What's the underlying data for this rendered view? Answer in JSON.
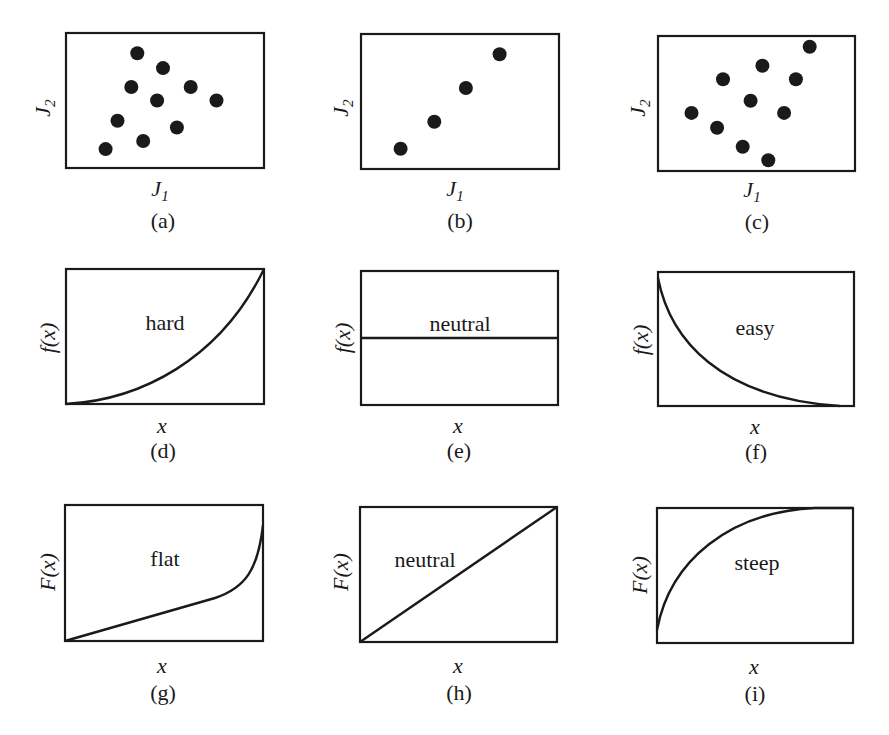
{
  "chart_data": [
    {
      "id": "a",
      "type": "scatter",
      "caption": "(a)",
      "xlabel": "J1",
      "ylabel": "J2",
      "points": [
        [
          0.36,
          0.15
        ],
        [
          0.49,
          0.26
        ],
        [
          0.33,
          0.4
        ],
        [
          0.63,
          0.4
        ],
        [
          0.46,
          0.5
        ],
        [
          0.76,
          0.5
        ],
        [
          0.26,
          0.65
        ],
        [
          0.56,
          0.7
        ],
        [
          0.39,
          0.8
        ],
        [
          0.2,
          0.86
        ]
      ]
    },
    {
      "id": "b",
      "type": "scatter",
      "caption": "(b)",
      "xlabel": "J1",
      "ylabel": "J2",
      "points": [
        [
          0.2,
          0.85
        ],
        [
          0.37,
          0.65
        ],
        [
          0.53,
          0.4
        ],
        [
          0.7,
          0.15
        ]
      ]
    },
    {
      "id": "c",
      "type": "scatter",
      "caption": "(c)",
      "xlabel": "J1",
      "ylabel": "J2",
      "points": [
        [
          0.77,
          0.08
        ],
        [
          0.53,
          0.22
        ],
        [
          0.33,
          0.32
        ],
        [
          0.7,
          0.32
        ],
        [
          0.47,
          0.48
        ],
        [
          0.17,
          0.57
        ],
        [
          0.64,
          0.57
        ],
        [
          0.3,
          0.68
        ],
        [
          0.43,
          0.82
        ],
        [
          0.56,
          0.92
        ]
      ]
    },
    {
      "id": "d",
      "type": "line",
      "caption": "(d)",
      "label": "hard",
      "xlabel": "x",
      "ylabel": "f(x)",
      "shape": "convex increasing from bottom-left to top-right"
    },
    {
      "id": "e",
      "type": "line",
      "caption": "(e)",
      "label": "neutral",
      "xlabel": "x",
      "ylabel": "f(x)",
      "shape": "horizontal constant line at mid height"
    },
    {
      "id": "f",
      "type": "line",
      "caption": "(f)",
      "label": "easy",
      "xlabel": "x",
      "ylabel": "f(x)",
      "shape": "convex decreasing from top-left to bottom-right"
    },
    {
      "id": "g",
      "type": "line",
      "caption": "(g)",
      "label": "flat",
      "xlabel": "x",
      "ylabel": "F(x)",
      "shape": "slow linear rise then sharp increase near right edge"
    },
    {
      "id": "h",
      "type": "line",
      "caption": "(h)",
      "label": "neutral",
      "xlabel": "x",
      "ylabel": "F(x)",
      "shape": "diagonal straight line from bottom-left to top-right"
    },
    {
      "id": "i",
      "type": "line",
      "caption": "(i)",
      "label": "steep",
      "xlabel": "x",
      "ylabel": "F(x)",
      "shape": "concave rapid rise from bottom-left flattening to top-right"
    }
  ],
  "panels": {
    "a": {
      "caption": "(a)",
      "xlabel": "J",
      "xsub": "1",
      "ylabel": "J",
      "ysub": "2"
    },
    "b": {
      "caption": "(b)",
      "xlabel": "J",
      "xsub": "1",
      "ylabel": "J",
      "ysub": "2"
    },
    "c": {
      "caption": "(c)",
      "xlabel": "J",
      "xsub": "1",
      "ylabel": "J",
      "ysub": "2"
    },
    "d": {
      "caption": "(d)",
      "label": "hard",
      "xlabel": "x",
      "ylabel": "f(x)"
    },
    "e": {
      "caption": "(e)",
      "label": "neutral",
      "xlabel": "x",
      "ylabel": "f(x)"
    },
    "f": {
      "caption": "(f)",
      "label": "easy",
      "xlabel": "x",
      "ylabel": "f(x)"
    },
    "g": {
      "caption": "(g)",
      "label": "flat",
      "xlabel": "x",
      "ylabel": "F(x)"
    },
    "h": {
      "caption": "(h)",
      "label": "neutral",
      "xlabel": "x",
      "ylabel": "F(x)"
    },
    "i": {
      "caption": "(i)",
      "label": "steep",
      "xlabel": "x",
      "ylabel": "F(x)"
    }
  }
}
